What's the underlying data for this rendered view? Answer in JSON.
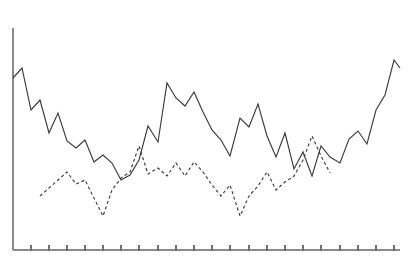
{
  "chart_data": {
    "type": "line",
    "title": "",
    "subtitle": "",
    "xlabel": "",
    "ylabel": "",
    "grid": false,
    "legend_position": "none",
    "axis": {
      "y_axis_visible": true,
      "x_axis_visible": true,
      "y_axis_tick_labels": [],
      "x_axis_tick_labels": [],
      "x_tick_count": 22,
      "xlim": [
        0,
        43
      ],
      "ylim": [
        0,
        100
      ],
      "pixel_origin_x": 13,
      "pixel_origin_y": 250,
      "pixel_plot_right": 400,
      "pixel_plot_top": 28
    },
    "series": [
      {
        "name": "series-solid",
        "style": "solid",
        "color": "#3b3b3b",
        "x": [
          13,
          22,
          31,
          40,
          49,
          58,
          67,
          76,
          85,
          94,
          103,
          112,
          121,
          130,
          139,
          148,
          158,
          167,
          176,
          185,
          194,
          203,
          212,
          221,
          230,
          240,
          249,
          258,
          267,
          276,
          285,
          294,
          303,
          312,
          321,
          330,
          340,
          349,
          358,
          367,
          376,
          385,
          394,
          400
        ],
        "values": [
          78,
          68,
          110,
          100,
          133,
          113,
          141,
          148,
          140,
          162,
          155,
          163,
          180,
          175,
          160,
          126,
          142,
          83,
          98,
          106,
          92,
          112,
          130,
          140,
          156,
          118,
          127,
          104,
          136,
          157,
          133,
          169,
          152,
          176,
          146,
          157,
          163,
          139,
          131,
          144,
          110,
          95,
          60,
          68
        ],
        "pixel_y": [
          78,
          68,
          110,
          100,
          133,
          113,
          141,
          148,
          140,
          162,
          155,
          163,
          180,
          175,
          160,
          126,
          142,
          83,
          98,
          106,
          92,
          112,
          130,
          140,
          156,
          118,
          127,
          104,
          136,
          157,
          133,
          169,
          152,
          176,
          146,
          157,
          163,
          139,
          131,
          144,
          110,
          95,
          60,
          68
        ]
      },
      {
        "name": "series-dashed",
        "style": "dashed",
        "color": "#3b3b3b",
        "x": [
          40,
          49,
          58,
          67,
          76,
          85,
          94,
          103,
          112,
          121,
          130,
          139,
          148,
          158,
          167,
          176,
          185,
          194,
          203,
          212,
          221,
          230,
          240,
          249,
          258,
          267,
          276,
          285,
          294,
          303,
          312,
          321,
          330
        ],
        "values": [
          196,
          188,
          180,
          172,
          184,
          180,
          198,
          216,
          190,
          178,
          172,
          146,
          174,
          168,
          176,
          163,
          176,
          162,
          172,
          185,
          196,
          185,
          216,
          196,
          186,
          172,
          190,
          182,
          176,
          160,
          136,
          156,
          173
        ],
        "pixel_y": [
          196,
          188,
          180,
          172,
          184,
          180,
          198,
          216,
          190,
          178,
          172,
          146,
          174,
          168,
          176,
          163,
          176,
          162,
          172,
          185,
          196,
          185,
          216,
          196,
          186,
          172,
          190,
          182,
          176,
          160,
          136,
          156,
          173
        ]
      }
    ],
    "tick_positions_x": [
      31,
      49,
      67,
      85,
      103,
      121,
      139,
      158,
      176,
      194,
      212,
      230,
      249,
      267,
      285,
      303,
      321,
      340,
      358,
      376,
      394
    ],
    "colors": {
      "axis": "#8a8a8a",
      "tick": "#6e6e6e",
      "line": "#3b3b3b",
      "background": "#ffffff"
    }
  }
}
